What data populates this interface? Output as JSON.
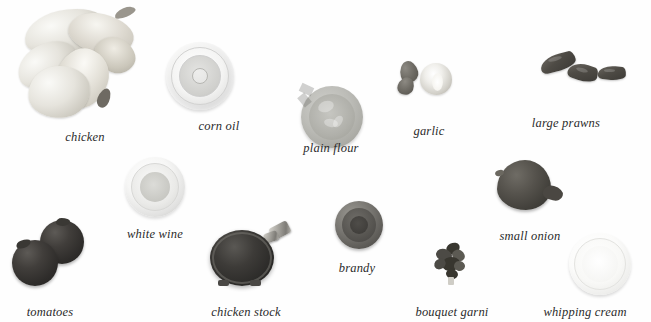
{
  "page": {
    "background_color": "#fefefe",
    "label_color": "#2b2b2b"
  },
  "items": [
    {
      "id": "chicken",
      "label": "chicken",
      "icon": "chicken-pieces-icon",
      "label_x": 85,
      "label_y": 130,
      "art_x": 75,
      "art_y": 64
    },
    {
      "id": "corn-oil",
      "label": "corn oil",
      "icon": "glass-bowl-of-oil-icon",
      "label_x": 219,
      "label_y": 119,
      "art_x": 200,
      "art_y": 76
    },
    {
      "id": "plain-flour",
      "label": "plain flour",
      "icon": "bowl-of-flour-icon",
      "label_x": 331,
      "label_y": 141,
      "art_x": 332,
      "art_y": 117
    },
    {
      "id": "garlic",
      "label": "garlic",
      "icon": "garlic-bulb-and-cloves-icon",
      "label_x": 429,
      "label_y": 124,
      "art_x": 428,
      "art_y": 80
    },
    {
      "id": "large-prawns",
      "label": "large prawns",
      "icon": "prawns-icon",
      "label_x": 566,
      "label_y": 116,
      "art_x": 583,
      "art_y": 73
    },
    {
      "id": "white-wine",
      "label": "white wine",
      "icon": "glass-bowl-of-white-wine-icon",
      "label_x": 155,
      "label_y": 227,
      "art_x": 155,
      "art_y": 187
    },
    {
      "id": "small-onion",
      "label": "small onion",
      "icon": "onion-icon",
      "label_x": 530,
      "label_y": 229,
      "art_x": 530,
      "art_y": 186
    },
    {
      "id": "brandy",
      "label": "brandy",
      "icon": "bowl-of-brandy-icon",
      "label_x": 357,
      "label_y": 261,
      "art_x": 359,
      "art_y": 225
    },
    {
      "id": "tomatoes",
      "label": "tomatoes",
      "icon": "tomatoes-icon",
      "label_x": 50,
      "label_y": 305,
      "art_x": 52,
      "art_y": 254
    },
    {
      "id": "chicken-stock",
      "label": "chicken stock",
      "icon": "stock-pot-icon",
      "label_x": 246,
      "label_y": 305,
      "art_x": 253,
      "art_y": 258
    },
    {
      "id": "bouquet-garni",
      "label": "bouquet garni",
      "icon": "herb-bundle-icon",
      "label_x": 452,
      "label_y": 305,
      "art_x": 452,
      "art_y": 267
    },
    {
      "id": "whipping-cream",
      "label": "whipping cream",
      "icon": "bowl-of-cream-icon",
      "label_x": 585,
      "label_y": 305,
      "art_x": 600,
      "art_y": 264
    }
  ]
}
